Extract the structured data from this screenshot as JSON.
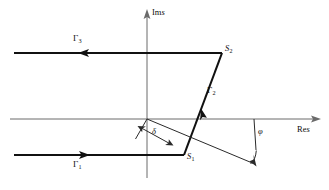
{
  "figure": {
    "background_color": "#ffffff",
    "axis_color": "#6a6a6a",
    "contour_color": "#111111",
    "width": 329,
    "height": 190
  },
  "axes": {
    "imaginary": {
      "label_italic": "s",
      "label_roman": "Im",
      "name": "im-axis",
      "x": 147,
      "top_y": 10,
      "bottom_y": 178,
      "arrow_direction": "up"
    },
    "real": {
      "label_italic": "s",
      "label_roman": "Re",
      "name": "re-axis",
      "y": 119,
      "left_x": 10,
      "right_x": 320,
      "arrow_direction": "right"
    }
  },
  "contour": {
    "name": "bromwich-contour",
    "segments": [
      {
        "id": "gamma3",
        "label": "Γ",
        "subscript": "3",
        "description": "upper horizontal ray, traversed leftward",
        "from_x": 222,
        "from_y": 53,
        "to_x": 14,
        "to_y": 53,
        "arrow_at_x": 84,
        "arrow_direction": "left"
      },
      {
        "id": "gamma2",
        "label": "Γ",
        "subscript": "2",
        "description": "diagonal segment from S1 to S2, traversed upward",
        "from_x": 184,
        "from_y": 155,
        "to_x": 222,
        "to_y": 53,
        "arrow_at_x": 199,
        "arrow_at_y": 114,
        "arrow_direction": "up-right"
      },
      {
        "id": "gamma1",
        "label": "Γ",
        "subscript": "1",
        "description": "lower horizontal ray, traversed rightward",
        "from_x": 14,
        "from_y": 155,
        "to_x": 184,
        "to_y": 155,
        "arrow_at_x": 84,
        "arrow_direction": "right"
      }
    ]
  },
  "points": [
    {
      "id": "s2",
      "label": "S",
      "subscript": "2",
      "x": 222,
      "y": 53,
      "label_x": 225,
      "label_y": 45
    },
    {
      "id": "s1",
      "label": "S",
      "subscript": "1",
      "x": 184,
      "y": 155,
      "label_x": 187,
      "label_y": 152
    }
  ],
  "annotations": {
    "delta": {
      "id": "delta-measure",
      "symbol": "δ",
      "description": "double-headed arrow measuring perpendicular offset from origin to contour",
      "from_x": 139,
      "from_y": 127,
      "to_x": 172,
      "to_y": 145,
      "label_x": 153,
      "label_y": 130
    },
    "phi": {
      "id": "phi-angle",
      "symbol": "φ",
      "description": "angle between the real axis and the slanted ray, measured with a curved arc",
      "label_x": 257,
      "label_y": 128,
      "vertex_x": 254,
      "vertex_y": 119,
      "arc_radius": 34
    },
    "slant_ray": {
      "id": "slant-ray",
      "description": "thin ray from the origin down to the right, terminating in an arrowhead",
      "from_x": 147,
      "from_y": 119,
      "to_x": 256,
      "to_y": 165
    },
    "origin_tick": {
      "id": "origin-perpendicular",
      "description": "short perpendicular tick at origin closing the delta triangle",
      "from_x": 147,
      "from_y": 119,
      "to_x": 136,
      "to_y": 138
    }
  }
}
